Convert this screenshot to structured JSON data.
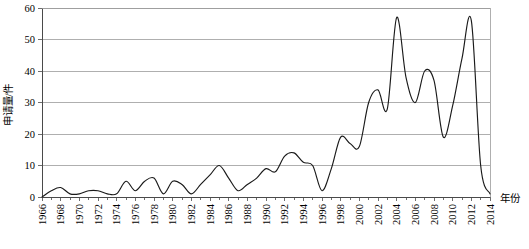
{
  "chart_data": {
    "type": "line",
    "title": "",
    "xlabel": "年份",
    "ylabel": "申请量/件",
    "xlim": [
      1966,
      2014
    ],
    "ylim": [
      0,
      60
    ],
    "ytick_step": 10,
    "xtick_step": 2,
    "grid": true,
    "legend": null,
    "legend_position": "none",
    "series_name": "申请量",
    "line_color": "#1a1a1a",
    "grid_color": "#9b9b9b",
    "axis_color": "#4a4a4a",
    "yticks": [
      0,
      10,
      20,
      30,
      40,
      50,
      60
    ],
    "ytick_labels": [
      "0",
      "10",
      "20",
      "30",
      "40",
      "50",
      "60"
    ],
    "xticks": [
      1966,
      1968,
      1970,
      1972,
      1974,
      1976,
      1978,
      1980,
      1982,
      1984,
      1986,
      1988,
      1990,
      1992,
      1994,
      1996,
      1998,
      2000,
      2002,
      2004,
      2006,
      2008,
      2010,
      2012,
      2014
    ],
    "xtick_labels": [
      "1966",
      "1968",
      "1970",
      "1972",
      "1974",
      "1976",
      "1978",
      "1980",
      "1982",
      "1984",
      "1986",
      "1988",
      "1990",
      "1992",
      "1994",
      "1996",
      "1998",
      "2000",
      "2002",
      "2004",
      "2006",
      "2008",
      "2010",
      "2012",
      "2014"
    ],
    "x": [
      1966,
      1967,
      1968,
      1969,
      1970,
      1971,
      1972,
      1973,
      1974,
      1975,
      1976,
      1977,
      1978,
      1979,
      1980,
      1981,
      1982,
      1983,
      1984,
      1985,
      1986,
      1987,
      1988,
      1989,
      1990,
      1991,
      1992,
      1993,
      1994,
      1995,
      1996,
      1997,
      1998,
      1999,
      2000,
      2001,
      2002,
      2003,
      2004,
      2005,
      2006,
      2007,
      2008,
      2009,
      2010,
      2011,
      2012,
      2013,
      2014
    ],
    "values": [
      0,
      2,
      3,
      1,
      1,
      2,
      2,
      1,
      1,
      5,
      2,
      5,
      6,
      1,
      5,
      4,
      1,
      4,
      7,
      10,
      6,
      2,
      4,
      6,
      9,
      8,
      13,
      14,
      11,
      10,
      2,
      9,
      19,
      17,
      16,
      30,
      34,
      28,
      57,
      38,
      30,
      40,
      37,
      19,
      29,
      44,
      56,
      10,
      1
    ]
  }
}
